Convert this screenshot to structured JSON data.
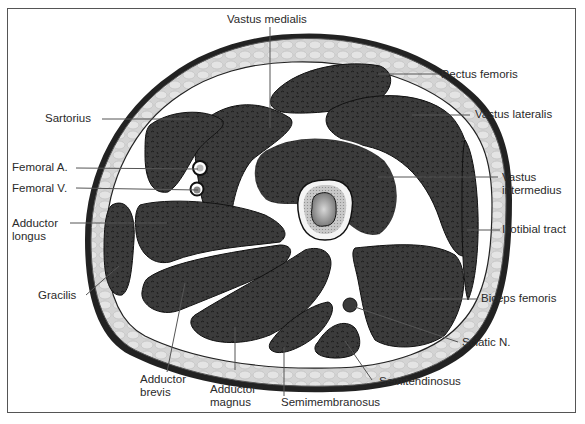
{
  "figure": {
    "colors": {
      "muscle": "#3a3a3a",
      "fascia": "#ffffff",
      "fat": "#cfcfcf",
      "skin": "#222222",
      "bone_cortex": "#f0f0f0",
      "bone_spongy": "#b9b9b9",
      "marrow": "#8a8a8a",
      "frame": "#555555",
      "leader": "#555555"
    },
    "labels": {
      "vastus_medialis": "Vastus medialis",
      "rectus_femoris": "Rectus femoris",
      "vastus_lateralis": "Vastus lateralis",
      "vastus_intermedius": "Vastus\nintermedius",
      "iliotibial_tract": "Iliotibial tract",
      "biceps_femoris": "Biceps femoris",
      "sciatic_n": "Sciatic N.",
      "semitendinosus": "Semitendinosus",
      "semimembranosus": "Semimembranosus",
      "adductor_magnus": "Adductor\nmagnus",
      "adductor_brevis": "Adductor\nbrevis",
      "gracilis": "Gracilis",
      "adductor_longus": "Adductor\nlongus",
      "femoral_v": "Femoral V.",
      "femoral_a": "Femoral A.",
      "sartorius": "Sartorius"
    }
  }
}
